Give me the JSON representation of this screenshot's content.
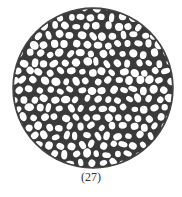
{
  "figure": {
    "caption": "(27)",
    "shape": "circle",
    "pattern": "irregular cellular mesh",
    "stroke_color": "#2b2b2b",
    "fill_color": "#ffffff"
  }
}
